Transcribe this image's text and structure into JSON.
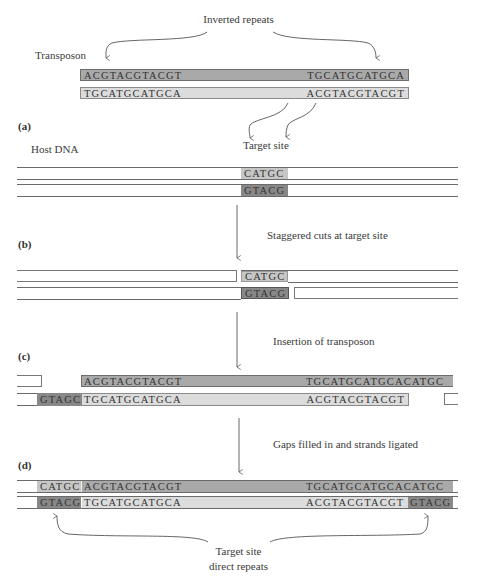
{
  "title": "Inverted repeats",
  "labels": {
    "transposon": "Transposon",
    "host_dna": "Host DNA",
    "target_site": "Target site",
    "target_site_repeats_line1": "Target site",
    "target_site_repeats_line2": "direct repeats"
  },
  "steps": [
    {
      "id": "a",
      "label": "(a)"
    },
    {
      "id": "b",
      "label": "(b)",
      "caption": "Staggered cuts at target site"
    },
    {
      "id": "c",
      "label": "(c)",
      "caption": "Insertion of transposon"
    },
    {
      "id": "d",
      "label": "(d)",
      "caption": "Gaps filled in and strands ligated"
    }
  ],
  "transposon": {
    "top_left": "ACGTACGTACGT",
    "top_right": "TGCATGCATGCA",
    "bottom_left": "TGCATGCATGCA",
    "bottom_right": "ACGTACGTACGT"
  },
  "target": {
    "top": "CATGC",
    "bottom": "GTACG"
  },
  "step_c": {
    "top_left": "ACGTACGTACGT",
    "top_right": "TGCATGCATGCACATGC",
    "bottom_fill": "GTAGC",
    "bottom_left": "TGCATGCATGCA",
    "bottom_right": "ACGTACGTACGT"
  },
  "step_d": {
    "top_fill": "CATGC",
    "top_left": "ACGTACGTACGT",
    "top_right": "TGCATGCATGCACATGC",
    "bottom_fill": "GTACG",
    "bottom_left": "TGCATGCATGCA",
    "bottom_right": "ACGTACGTACGT",
    "bottom_right_fill": "GTACG"
  },
  "colors": {
    "dark_strand": "#a9a9a9",
    "light_strand": "#dcdcdc",
    "target_light": "#c6c6c6",
    "target_dark": "#888888",
    "line": "#6a6a6a"
  }
}
